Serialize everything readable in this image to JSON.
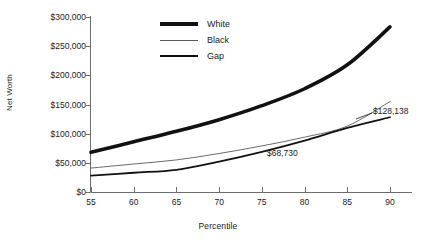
{
  "chart_data": {
    "type": "line",
    "title": "",
    "xlabel": "Percentile",
    "ylabel": "Net Worth",
    "x": [
      55,
      60,
      65,
      70,
      75,
      80,
      85,
      90
    ],
    "xlim": [
      55,
      90
    ],
    "ylim": [
      0,
      300000
    ],
    "xticks": [
      "55",
      "60",
      "65",
      "70",
      "75",
      "80",
      "85",
      "90"
    ],
    "yticks": [
      "$0",
      "$50,000",
      "$100,000",
      "$150,000",
      "$200,000",
      "$250,000",
      "$300,000"
    ],
    "ytick_values": [
      0,
      50000,
      100000,
      150000,
      200000,
      250000,
      300000
    ],
    "grid": false,
    "legend_position": "top-center",
    "series": [
      {
        "name": "White",
        "style": "thick",
        "color": "#111111",
        "values": [
          68000,
          86000,
          104000,
          124000,
          148000,
          177000,
          218000,
          283000
        ]
      },
      {
        "name": "Black",
        "style": "thin",
        "color": "#5a5a5a",
        "values": [
          41000,
          48000,
          55000,
          66000,
          79000,
          94000,
          113000,
          155000
        ]
      },
      {
        "name": "Gap",
        "style": "medium",
        "color": "#111111",
        "values": [
          28000,
          33000,
          38000,
          52000,
          68730,
          88000,
          110000,
          128138
        ]
      }
    ],
    "annotations": [
      {
        "text": "$68,730",
        "x": 78,
        "y": 58000
      },
      {
        "text": "$128,138",
        "x": 91,
        "y": 128138
      }
    ]
  },
  "legend": {
    "items": [
      {
        "label": "White"
      },
      {
        "label": "Black"
      },
      {
        "label": "Gap"
      }
    ]
  },
  "axes": {
    "y_title": "Net Worth",
    "x_title": "Percentile"
  }
}
